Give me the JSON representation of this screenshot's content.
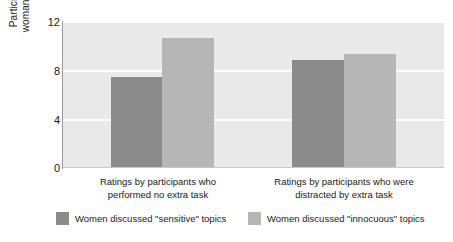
{
  "chart_data": {
    "type": "bar",
    "title": "",
    "xlabel": "",
    "ylabel": "Participants' ratings of woman's level of anxiety",
    "ylim": [
      0,
      12
    ],
    "yticks": [
      0,
      4,
      8,
      12
    ],
    "grid": true,
    "legend_position": "bottom",
    "categories": [
      "Ratings by participants who performed no extra task",
      "Ratings by participants who were distracted by extra task"
    ],
    "series": [
      {
        "name": "Women discussed \"sensitive\" topics",
        "color": "#8b8b8b",
        "values": [
          7.4,
          8.8
        ]
      },
      {
        "name": "Women discussed \"innocuous\" topics",
        "color": "#b6b6b6",
        "values": [
          10.6,
          9.3
        ]
      }
    ]
  },
  "axis": {
    "y_title_line1": "Participants' ratings of",
    "y_title_line2": "woman's level of anxiety",
    "tick_12": "12",
    "tick_8": "8",
    "tick_4": "4",
    "tick_0": "0"
  },
  "categories": [
    {
      "line1": "Ratings by participants who",
      "line2": "performed no extra task"
    },
    {
      "line1": "Ratings by participants who were",
      "line2": "distracted by extra task"
    }
  ],
  "legend": {
    "sensitive_label": "Women discussed \"sensitive\" topics",
    "innocuous_label": "Women discussed \"innocuous\" topics"
  },
  "colors": {
    "sensitive": "#8b8b8b",
    "innocuous": "#b6b6b6",
    "plot_background": "#e9e9e9",
    "gridline": "#fdfdfd"
  }
}
